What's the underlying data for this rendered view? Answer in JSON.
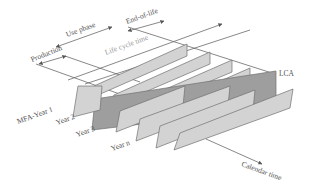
{
  "diagram": {
    "labels": {
      "production": "Production",
      "use_phase": "Use phase",
      "end_of_life": "End-of-life",
      "life_cycle_time": "Life cycle time",
      "lca": "LCA",
      "calendar_time": "Calendar time",
      "years": [
        "MFA-Year 1",
        "Year 2",
        "Year 3",
        "Year n"
      ]
    },
    "colors": {
      "year_plane": "#d3d3d3",
      "lca_plane": "#9e9e9e",
      "lines": "#6a6a6a",
      "text": "#555555"
    },
    "plane_count": 5
  }
}
